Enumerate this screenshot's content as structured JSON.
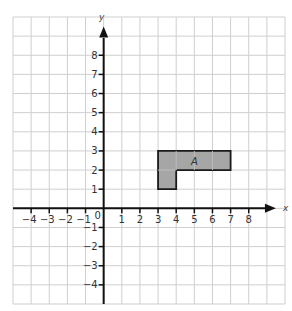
{
  "figure": {
    "axes": {
      "x_label": "x",
      "y_label": "y",
      "origin_label": "0",
      "x_range": [
        -5,
        10
      ],
      "y_range": [
        -5,
        10
      ],
      "x_ticks": [
        -4,
        -3,
        -2,
        -1,
        1,
        2,
        3,
        4,
        5,
        6,
        7,
        8
      ],
      "y_ticks": [
        8,
        7,
        6,
        5,
        4,
        3,
        2,
        1,
        -1,
        -2,
        -3,
        -4
      ],
      "x_tick_labels": [
        "−4",
        "−3",
        "−2",
        "−1",
        "1",
        "2",
        "3",
        "4",
        "5",
        "6",
        "7",
        "8"
      ],
      "y_tick_labels": [
        "8",
        "7",
        "6",
        "5",
        "4",
        "3",
        "2",
        "1",
        "−1",
        "−2",
        "−3",
        "−4"
      ]
    },
    "shape": {
      "label": "A",
      "vertices": [
        [
          3,
          3
        ],
        [
          7,
          3
        ],
        [
          7,
          2
        ],
        [
          4,
          2
        ],
        [
          4,
          1
        ],
        [
          3,
          1
        ]
      ],
      "fill": "#a6a6a6",
      "stroke": "#1a1a1a"
    },
    "colors": {
      "grid": "#cfcfcf",
      "axis": "#111111",
      "text": "#333333"
    }
  }
}
